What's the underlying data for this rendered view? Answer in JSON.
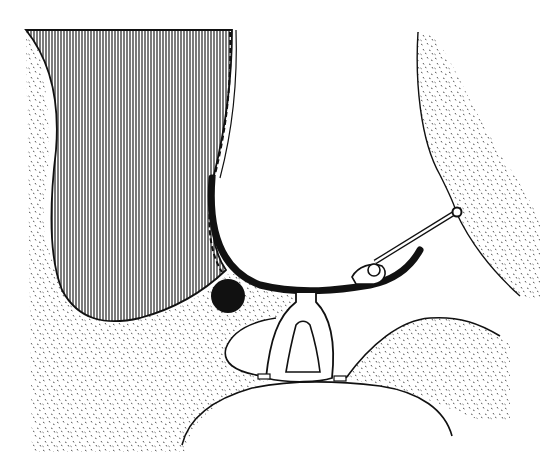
{
  "figure": {
    "type": "anatomical line drawing",
    "style": "black ink on white, stippled and hatched regions",
    "colors": {
      "ink": "#111111",
      "background": "#ffffff",
      "hatch": "#333333",
      "stipple": "#555555"
    },
    "regions": [
      {
        "id": "hatched-mass",
        "fill": "vertical line hatching"
      },
      {
        "id": "stippled-tissue-left",
        "fill": "stipple"
      },
      {
        "id": "stippled-tissue-right-upper",
        "fill": "stipple"
      },
      {
        "id": "stippled-tissue-right-lower",
        "fill": "stipple"
      },
      {
        "id": "black-circle",
        "fill": "solid black"
      },
      {
        "id": "curved-black-band",
        "fill": "solid black"
      },
      {
        "id": "central-strut-structure",
        "fill": "outline"
      },
      {
        "id": "thin-rod-with-ball-joint",
        "fill": "outline"
      }
    ],
    "labels": []
  }
}
